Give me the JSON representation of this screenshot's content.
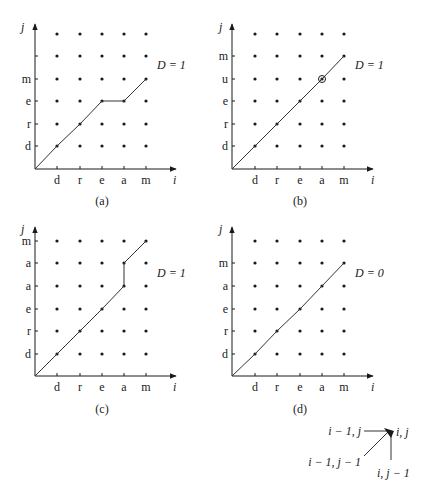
{
  "figure": {
    "panels": [
      {
        "id": "a",
        "caption": "(a)",
        "distance_label": "D = 1",
        "x_axis_label": "i",
        "y_axis_label": "j",
        "x_ticks": [
          "d",
          "r",
          "e",
          "a",
          "m"
        ],
        "y_ticks": [
          "d",
          "r",
          "e",
          "m",
          "",
          ""
        ],
        "path": [
          [
            0,
            0
          ],
          [
            1,
            1
          ],
          [
            2,
            2
          ],
          [
            3,
            3
          ],
          [
            4,
            3
          ],
          [
            5,
            4
          ]
        ]
      },
      {
        "id": "b",
        "caption": "(b)",
        "distance_label": "D = 1",
        "x_axis_label": "i",
        "y_axis_label": "j",
        "x_ticks": [
          "d",
          "r",
          "e",
          "a",
          "m"
        ],
        "y_ticks": [
          "d",
          "r",
          "e",
          "u",
          "m",
          ""
        ],
        "path": [
          [
            0,
            0
          ],
          [
            1,
            1
          ],
          [
            2,
            2
          ],
          [
            3,
            3
          ],
          [
            4,
            4
          ],
          [
            5,
            5
          ]
        ],
        "highlighted_point": [
          4,
          4
        ]
      },
      {
        "id": "c",
        "caption": "(c)",
        "distance_label": "D = 1",
        "x_axis_label": "i",
        "y_axis_label": "j",
        "x_ticks": [
          "d",
          "r",
          "e",
          "a",
          "m"
        ],
        "y_ticks": [
          "d",
          "r",
          "e",
          "a",
          "a",
          "m"
        ],
        "path": [
          [
            0,
            0
          ],
          [
            1,
            1
          ],
          [
            2,
            2
          ],
          [
            3,
            3
          ],
          [
            4,
            4
          ],
          [
            4,
            5
          ],
          [
            5,
            6
          ]
        ]
      },
      {
        "id": "d",
        "caption": "(d)",
        "distance_label": "D = 0",
        "x_axis_label": "i",
        "y_axis_label": "j",
        "x_ticks": [
          "d",
          "r",
          "e",
          "a",
          "m"
        ],
        "y_ticks": [
          "d",
          "r",
          "e",
          "a",
          "m",
          ""
        ],
        "path": [
          [
            0,
            0
          ],
          [
            1,
            1
          ],
          [
            2,
            2
          ],
          [
            3,
            3
          ],
          [
            4,
            4
          ],
          [
            5,
            5
          ]
        ]
      }
    ],
    "legend": {
      "target": "i, j",
      "left": "i − 1, j",
      "diag": "i − 1, j − 1",
      "below": "i, j − 1"
    }
  }
}
